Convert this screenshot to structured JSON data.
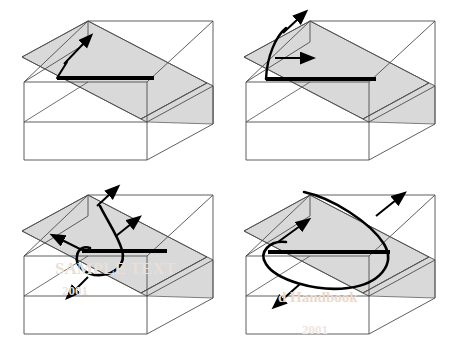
{
  "figure": {
    "type": "technical-illustration",
    "panel_count": 4,
    "layout": "2x2 grid",
    "background_color": "#ffffff"
  },
  "style": {
    "slip_plane_fill": "#d9d9d9",
    "slip_plane_fill_light": "#e0e0e0",
    "box_edge_color": "#4d4d4d",
    "dislocation_color": "#000000",
    "arrow_color": "#000000",
    "watermark_color": "#e6dcd2"
  },
  "panels": [
    {
      "id": "panel-a",
      "label": "a",
      "caption": "Initial straight dislocation segment with small kink",
      "stage": 1,
      "arrow_count": 1,
      "arrows": [
        {
          "name": "glide-direction-arrow",
          "direction": "up-right"
        }
      ],
      "has_loop": false,
      "dislocation_shape": "straight-line-with-kink"
    },
    {
      "id": "panel-b",
      "label": "b",
      "caption": "Dislocation bows out into a shallow arc",
      "stage": 2,
      "arrow_count": 2,
      "arrows": [
        {
          "name": "glide-direction-arrow-upper",
          "direction": "up-right"
        },
        {
          "name": "glide-direction-arrow-lower",
          "direction": "right"
        }
      ],
      "has_loop": false,
      "dislocation_shape": "bowed-arc"
    },
    {
      "id": "panel-c",
      "label": "c",
      "caption": "Dislocation curls into a partial loop around the pinning points",
      "stage": 3,
      "arrow_count": 4,
      "arrows": [
        {
          "name": "glide-direction-arrow-top",
          "direction": "up-right"
        },
        {
          "name": "glide-direction-arrow-right",
          "direction": "up-right"
        },
        {
          "name": "glide-direction-arrow-left",
          "direction": "up-left"
        },
        {
          "name": "glide-direction-arrow-bottom",
          "direction": "down-left"
        }
      ],
      "has_loop": true,
      "dislocation_shape": "small-closed-loop"
    },
    {
      "id": "panel-d",
      "label": "d",
      "caption": "Loop expands across the slip plane",
      "stage": 4,
      "arrow_count": 3,
      "arrows": [
        {
          "name": "glide-direction-arrow-upper-right",
          "direction": "up-right"
        },
        {
          "name": "glide-direction-arrow-inner",
          "direction": "up-right"
        },
        {
          "name": "glide-direction-arrow-lower-left",
          "direction": "down-left"
        }
      ],
      "has_loop": true,
      "dislocation_shape": "large-expanded-loop"
    }
  ],
  "watermarks": [
    {
      "name": "watermark-panel-c-line1",
      "text": "SAMPLE TEXT",
      "panel": "panel-c"
    },
    {
      "name": "watermark-panel-c-line2",
      "text": "2001",
      "panel": "panel-c"
    },
    {
      "name": "watermark-panel-d-line1",
      "text": "d Handbook",
      "panel": "panel-d"
    },
    {
      "name": "watermark-panel-d-line2",
      "text": "2001",
      "panel": "panel-d"
    }
  ]
}
